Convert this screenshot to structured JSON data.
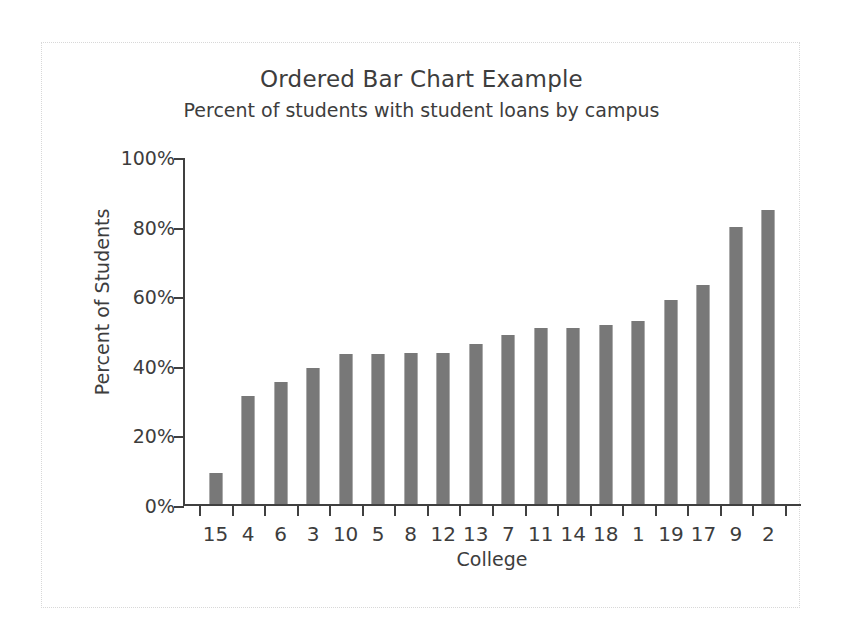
{
  "chart_data": {
    "type": "bar",
    "title": "Ordered Bar Chart Example",
    "subtitle": "Percent of students with student loans by campus",
    "xlabel": "College",
    "ylabel": "Percent of Students",
    "categories": [
      "15",
      "4",
      "6",
      "3",
      "10",
      "5",
      "8",
      "12",
      "13",
      "7",
      "11",
      "14",
      "18",
      "1",
      "19",
      "17",
      "9",
      "2"
    ],
    "values": [
      9,
      31,
      35,
      39,
      43,
      43,
      43.5,
      43.5,
      46,
      48.5,
      50.5,
      50.5,
      51.5,
      52.5,
      58.5,
      63,
      79.5,
      84.5
    ],
    "value_suffix": "%",
    "ylim": [
      0,
      100
    ],
    "ytick_values": [
      0,
      20,
      40,
      60,
      80,
      100
    ],
    "ytick_labels": [
      "0%",
      "20%",
      "40%",
      "60%",
      "80%",
      "100%"
    ],
    "grid": false,
    "legend": "none",
    "bar_color": "#808080",
    "axis_color": "#404040",
    "text_color": "#3d3d3d",
    "frame_color": "#d8d8d8"
  }
}
